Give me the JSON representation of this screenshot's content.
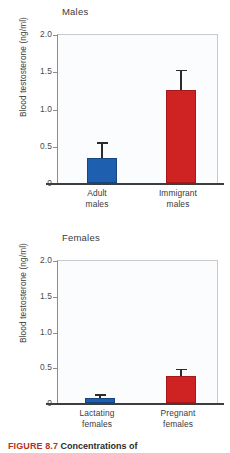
{
  "figure": {
    "caption_number": "FIGURE 8.7",
    "caption_text": "Concentrations of"
  },
  "axis": {
    "ylabel": "Blood testosterone (ng/ml)",
    "ticks": [
      "2.0",
      "1.5",
      "1.0",
      "0.5",
      "0"
    ]
  },
  "colors": {
    "blue": "#1f5fb0",
    "red": "#cf2222",
    "error_bar": "#2b2b2b",
    "axis": "#3d3d3d",
    "plot_background": "#fbfcfd"
  },
  "chart_data": [
    {
      "type": "bar",
      "title": "Males",
      "xlabel": "",
      "ylabel": "Blood testosterone (ng/ml)",
      "ylim": [
        0,
        2.0
      ],
      "yticks": [
        0,
        0.5,
        1.0,
        1.5,
        2.0
      ],
      "ytick_labels": [
        "0",
        "0.5",
        "1.0",
        "1.5",
        "2.0"
      ],
      "grid": false,
      "legend": "none",
      "categories": [
        "Adult\nmales",
        "Immigrant\nmales"
      ],
      "category_labels": [
        "Adult males",
        "Immigrant males"
      ],
      "values": [
        0.33,
        1.25
      ],
      "errors": [
        0.2,
        0.25
      ],
      "bar_colors": [
        "#1f5fb0",
        "#cf2222"
      ]
    },
    {
      "type": "bar",
      "title": "Females",
      "xlabel": "",
      "ylabel": "Blood testosterone (ng/ml)",
      "ylim": [
        0,
        2.0
      ],
      "yticks": [
        0,
        0.5,
        1.0,
        1.5,
        2.0
      ],
      "ytick_labels": [
        "0",
        "0.5",
        "1.0",
        "1.5",
        "2.0"
      ],
      "grid": false,
      "legend": "none",
      "categories": [
        "Lactating\nfemales",
        "Pregnant\nfemales"
      ],
      "category_labels": [
        "Lactating females",
        "Pregnant females"
      ],
      "values": [
        0.07,
        0.38
      ],
      "errors": [
        0.03,
        0.08
      ],
      "bar_colors": [
        "#1f5fb0",
        "#cf2222"
      ]
    }
  ]
}
